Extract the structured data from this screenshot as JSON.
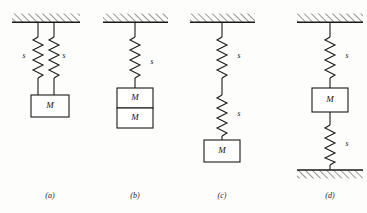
{
  "figure": {
    "background_color": "#fdfdfb",
    "line_color": "#1a1a1a",
    "box_fill": "#ffffff",
    "panels": [
      {
        "id": "a",
        "caption": "(a)",
        "caption_x": 46,
        "caption_y": 191,
        "support": {
          "type": "ceiling",
          "x": 12,
          "y": 22,
          "width": 68,
          "hatch_side": "above"
        },
        "mass_label": "M",
        "springs": [
          {
            "label": "s",
            "label_x": 24,
            "label_y": 55,
            "orientation": "vertical"
          },
          {
            "label": "s",
            "label_x": 64,
            "label_y": 55,
            "orientation": "vertical"
          }
        ],
        "masses": [
          {
            "label": "M",
            "x": 31,
            "y": 95,
            "width": 38,
            "height": 22
          }
        ],
        "description": "two springs in parallel supporting one mass"
      },
      {
        "id": "b",
        "caption": "(b)",
        "caption_x": 131,
        "caption_y": 191,
        "support": {
          "type": "ceiling",
          "x": 103,
          "y": 22,
          "width": 65,
          "hatch_side": "above"
        },
        "springs": [
          {
            "label": "s",
            "label_x": 143,
            "label_y": 55,
            "orientation": "vertical"
          }
        ],
        "masses": [
          {
            "label": "M",
            "x": 117,
            "y": 88,
            "width": 36,
            "height": 20
          },
          {
            "label": "M",
            "x": 117,
            "y": 108,
            "width": 36,
            "height": 20
          }
        ],
        "description": "one spring supporting two stacked masses"
      },
      {
        "id": "c",
        "caption": "(c)",
        "caption_x": 212,
        "caption_y": 191,
        "support": {
          "type": "ceiling",
          "x": 190,
          "y": 22,
          "width": 65,
          "hatch_side": "above"
        },
        "springs": [
          {
            "label": "s",
            "label_x": 230,
            "label_y": 55,
            "orientation": "vertical"
          },
          {
            "label": "s",
            "label_x": 230,
            "label_y": 113,
            "orientation": "vertical"
          }
        ],
        "masses": [
          {
            "label": "M",
            "x": 204,
            "y": 140,
            "width": 36,
            "height": 22
          }
        ],
        "description": "two springs in series supporting one mass"
      },
      {
        "id": "d",
        "caption": "(d)",
        "caption_x": 308,
        "caption_y": 191,
        "support": {
          "type": "ceiling",
          "x": 297,
          "y": 22,
          "width": 66,
          "hatch_side": "above"
        },
        "floor": {
          "type": "floor",
          "x": 297,
          "y": 170,
          "width": 66,
          "hatch_side": "below"
        },
        "springs": [
          {
            "label": "s",
            "label_x": 340,
            "label_y": 55,
            "orientation": "vertical"
          },
          {
            "label": "s",
            "label_x": 340,
            "label_y": 143,
            "orientation": "vertical"
          }
        ],
        "masses": [
          {
            "label": "M",
            "x": 312,
            "y": 88,
            "width": 36,
            "height": 24
          }
        ],
        "description": "mass between a ceiling spring and a floor spring"
      }
    ]
  }
}
